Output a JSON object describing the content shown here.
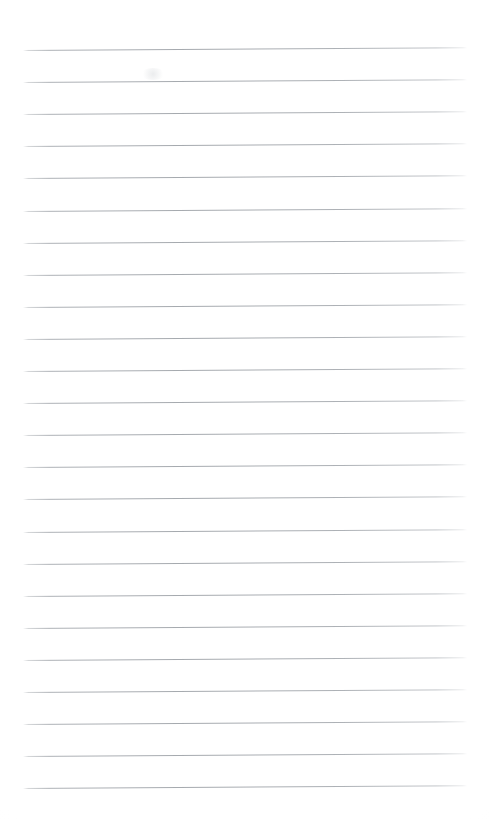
{
  "document": {
    "kind": "lined-notebook-page",
    "title": "Blank lined paper",
    "content_text": "",
    "page_width": 489,
    "page_height": 819,
    "background_color": "#ffffff",
    "rule_color": "#a6aaaf",
    "margins": {
      "top": 50,
      "bottom": 31,
      "left": 23,
      "right": 22
    },
    "ruling": {
      "line_count": 24,
      "first_line_y": 50,
      "line_spacing": 32.1,
      "line_start_x": 23,
      "line_end_x": 467,
      "line_thickness": 1,
      "skew_degrees": -0.35,
      "style": "wide-ruled"
    },
    "lines": [
      {
        "index": 1,
        "y": 50.0,
        "text": ""
      },
      {
        "index": 2,
        "y": 82.1,
        "text": ""
      },
      {
        "index": 3,
        "y": 114.2,
        "text": ""
      },
      {
        "index": 4,
        "y": 146.3,
        "text": ""
      },
      {
        "index": 5,
        "y": 178.4,
        "text": ""
      },
      {
        "index": 6,
        "y": 210.5,
        "text": ""
      },
      {
        "index": 7,
        "y": 242.6,
        "text": ""
      },
      {
        "index": 8,
        "y": 274.7,
        "text": ""
      },
      {
        "index": 9,
        "y": 306.8,
        "text": ""
      },
      {
        "index": 10,
        "y": 338.9,
        "text": ""
      },
      {
        "index": 11,
        "y": 371.0,
        "text": ""
      },
      {
        "index": 12,
        "y": 403.1,
        "text": ""
      },
      {
        "index": 13,
        "y": 435.2,
        "text": ""
      },
      {
        "index": 14,
        "y": 467.3,
        "text": ""
      },
      {
        "index": 15,
        "y": 499.4,
        "text": ""
      },
      {
        "index": 16,
        "y": 531.5,
        "text": ""
      },
      {
        "index": 17,
        "y": 563.6,
        "text": ""
      },
      {
        "index": 18,
        "y": 595.7,
        "text": ""
      },
      {
        "index": 19,
        "y": 627.8,
        "text": ""
      },
      {
        "index": 20,
        "y": 659.9,
        "text": ""
      },
      {
        "index": 21,
        "y": 692.0,
        "text": ""
      },
      {
        "index": 22,
        "y": 724.1,
        "text": ""
      },
      {
        "index": 23,
        "y": 756.2,
        "text": ""
      },
      {
        "index": 24,
        "y": 788.3,
        "text": ""
      }
    ],
    "artifacts": [
      {
        "name": "scan-smudge",
        "x": 140,
        "y": 68,
        "width": 26,
        "height": 12
      }
    ]
  }
}
